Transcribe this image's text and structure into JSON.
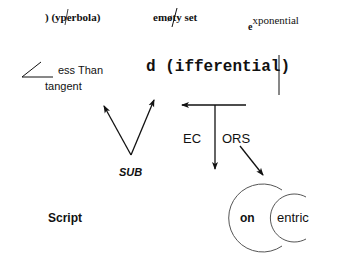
{
  "puzzles": {
    "hyperbola": {
      "text": ") (yperbola)"
    },
    "empty_set": {
      "prefix": "em",
      "glyph": "ø",
      "suffix": "ty set"
    },
    "exponential": {
      "base": "e",
      "superscript": "xponential"
    },
    "less_than_tangent": {
      "line1": "ess Than",
      "line2": "tangent"
    },
    "differential": {
      "text": "d (ifferential)"
    },
    "sub": {
      "text": "SUB"
    },
    "vectors": {
      "left": "EC",
      "right": "ORS"
    },
    "script": {
      "text": "Script"
    },
    "concentric": {
      "outer": "on",
      "inner": "entric"
    }
  },
  "colors": {
    "ink": "#111111",
    "arc": "#555555",
    "background": "#ffffff"
  }
}
